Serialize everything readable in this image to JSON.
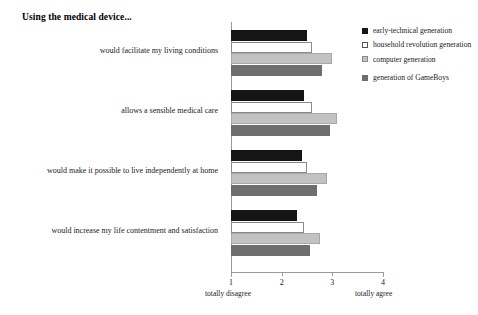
{
  "chart_data": {
    "type": "bar",
    "orientation": "horizontal",
    "title": "Using the medical device...",
    "xlabel": "",
    "ylabel": "",
    "xlim": [
      1,
      4
    ],
    "xticks": [
      1,
      2,
      3,
      4
    ],
    "xticklabels": [
      "1",
      "2",
      "3",
      "4"
    ],
    "scale_low_label": "totally disagree",
    "scale_high_label": "totally agree",
    "grid": false,
    "legend_position": "right",
    "categories": [
      "would facilitate my living conditions",
      "allows a sensible medical care",
      "would make it possible to live independently at home",
      "would increase my life contentment and satisfaction"
    ],
    "series": [
      {
        "name": "early-technical generation",
        "color": "#151515",
        "values": [
          2.5,
          2.45,
          2.4,
          2.3
        ]
      },
      {
        "name": "household revolution generation",
        "color": "#ffffff",
        "values": [
          2.6,
          2.6,
          2.5,
          2.45
        ]
      },
      {
        "name": "computer generation",
        "color": "#c2c2c2",
        "values": [
          3.0,
          3.1,
          2.9,
          2.75
        ]
      },
      {
        "name": "generation of GameBoys",
        "color": "#6e6e6e",
        "values": [
          2.8,
          2.95,
          2.7,
          2.55
        ]
      }
    ]
  },
  "legend": {
    "items": [
      {
        "label": "early-technical generation"
      },
      {
        "label": "household revolution generation"
      },
      {
        "label": "computer generation"
      },
      {
        "label": "generation of GameBoys"
      }
    ]
  }
}
